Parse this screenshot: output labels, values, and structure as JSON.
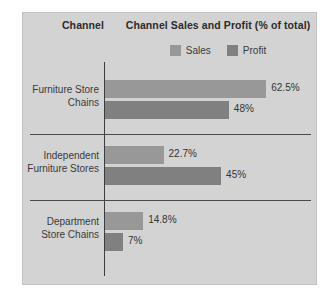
{
  "panel": {
    "background_color": "#d3d3d3",
    "border_color": "#c2c2c2"
  },
  "headers": {
    "channel": "Channel",
    "metric": "Channel Sales and Profit (% of total)"
  },
  "legend": {
    "items": [
      {
        "label": "Sales",
        "color": "#989898",
        "swatch_name": "legend-swatch-sales"
      },
      {
        "label": "Profit",
        "color": "#808080",
        "swatch_name": "legend-swatch-profit"
      }
    ]
  },
  "chart_data": {
    "type": "bar",
    "orientation": "horizontal",
    "title": "Channel Sales and Profit (% of total)",
    "xlabel": "",
    "ylabel": "Channel",
    "grid": false,
    "legend_position": "top",
    "axis_line": true,
    "xlim": [
      0,
      70
    ],
    "px_per_percent": 2.58,
    "categories": [
      "Furniture Store Chains",
      "Independent Furniture Stores",
      "Department Store Chains"
    ],
    "series": [
      {
        "name": "Sales",
        "color": "#989898",
        "values": [
          62.5,
          22.7,
          14.8
        ],
        "labels": [
          "62.5%",
          "22.7%",
          "14.8%"
        ]
      },
      {
        "name": "Profit",
        "color": "#808080",
        "values": [
          48,
          45,
          7
        ],
        "labels": [
          "48%",
          "45%",
          "7%"
        ]
      }
    ]
  },
  "groups": [
    {
      "name": "furniture-store-chains",
      "label_lines": [
        "Furniture Store",
        "Chains"
      ],
      "bars": [
        {
          "series": "Sales",
          "value": 62.5,
          "label": "62.5%",
          "color": "#989898"
        },
        {
          "series": "Profit",
          "value": 48,
          "label": "48%",
          "color": "#808080"
        }
      ]
    },
    {
      "name": "independent-furniture-stores",
      "label_lines": [
        "Independent",
        "Furniture Stores"
      ],
      "bars": [
        {
          "series": "Sales",
          "value": 22.7,
          "label": "22.7%",
          "color": "#989898"
        },
        {
          "series": "Profit",
          "value": 45,
          "label": "45%",
          "color": "#808080"
        }
      ]
    },
    {
      "name": "department-store-chains",
      "label_lines": [
        "Department",
        "Store Chains"
      ],
      "bars": [
        {
          "series": "Sales",
          "value": 14.8,
          "label": "14.8%",
          "color": "#989898"
        },
        {
          "series": "Profit",
          "value": 7,
          "label": "7%",
          "color": "#808080"
        }
      ]
    }
  ]
}
